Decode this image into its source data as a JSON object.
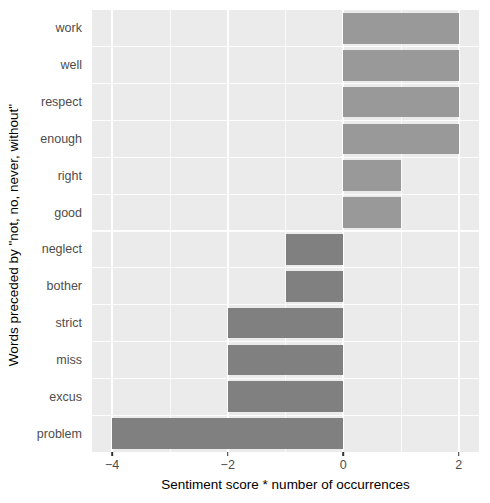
{
  "chart_data": {
    "type": "bar",
    "orientation": "horizontal",
    "title": "",
    "xlabel": "Sentiment score * number of occurrences",
    "ylabel": "Words preceded by \"not, no, never, without\"",
    "categories": [
      "work",
      "well",
      "respect",
      "enough",
      "right",
      "good",
      "neglect",
      "bother",
      "strict",
      "miss",
      "excus",
      "problem"
    ],
    "values": [
      2,
      2,
      2,
      2,
      1,
      1,
      -1,
      -1,
      -2,
      -2,
      -2,
      -4
    ],
    "xlim": [
      -4.35,
      2.35
    ],
    "xticks": [
      -4,
      -2,
      0,
      2
    ],
    "xtick_labels": [
      "−4",
      "−2",
      "0",
      "2"
    ],
    "x_minor_ticks": [
      -3,
      -1,
      1
    ],
    "grid": true,
    "legend": "none",
    "colors": {
      "positive_bar": "#999999",
      "negative_bar": "#808080",
      "panel_background": "#ebebeb",
      "gridline": "#ffffff",
      "axis_text": "#4d4d4d",
      "axis_title": "#000000"
    },
    "bars": [
      {
        "category": "work",
        "value": 2,
        "sign": "positive"
      },
      {
        "category": "well",
        "value": 2,
        "sign": "positive"
      },
      {
        "category": "respect",
        "value": 2,
        "sign": "positive"
      },
      {
        "category": "enough",
        "value": 2,
        "sign": "positive"
      },
      {
        "category": "right",
        "value": 1,
        "sign": "positive"
      },
      {
        "category": "good",
        "value": 1,
        "sign": "positive"
      },
      {
        "category": "neglect",
        "value": -1,
        "sign": "negative"
      },
      {
        "category": "bother",
        "value": -1,
        "sign": "negative"
      },
      {
        "category": "strict",
        "value": -2,
        "sign": "negative"
      },
      {
        "category": "miss",
        "value": -2,
        "sign": "negative"
      },
      {
        "category": "excus",
        "value": -2,
        "sign": "negative"
      },
      {
        "category": "problem",
        "value": -4,
        "sign": "negative"
      }
    ]
  }
}
